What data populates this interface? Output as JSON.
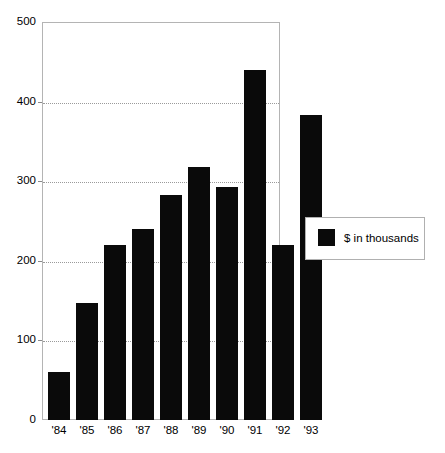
{
  "chart_data": {
    "type": "bar",
    "title": "",
    "subtitle": "",
    "xlabel": "",
    "ylabel": "",
    "categories": [
      "'84",
      "'85",
      "'86",
      "'87",
      "'88",
      "'89",
      "'90",
      "'91",
      "'92",
      "'93"
    ],
    "values": [
      60,
      147,
      220,
      240,
      283,
      318,
      293,
      440,
      220,
      383
    ],
    "series": [
      {
        "name": "$ in thousands",
        "color": "#0a0a0a",
        "values": [
          60,
          147,
          220,
          240,
          283,
          318,
          293,
          440,
          220,
          383
        ]
      }
    ],
    "ylim": [
      0,
      500
    ],
    "yticks": [
      0,
      100,
      200,
      300,
      400,
      500
    ],
    "ytick_labels": [
      "0",
      "100",
      "200",
      "300",
      "400",
      "500"
    ],
    "xtick_labels": [
      "'84",
      "'85",
      "'86",
      "'87",
      "'88",
      "'89",
      "'90",
      "'91",
      "'92",
      "'93"
    ],
    "grid": true,
    "gridlines_at": [
      100,
      200,
      300,
      400
    ],
    "legend": {
      "position": "right",
      "entries": [
        {
          "label": "$ in thousands",
          "color": "#0a0a0a",
          "swatch": "filled-square"
        }
      ]
    },
    "axis_color": "#b4b4b4",
    "grid_color": "#9a9a9a",
    "background": "#ffffff"
  }
}
